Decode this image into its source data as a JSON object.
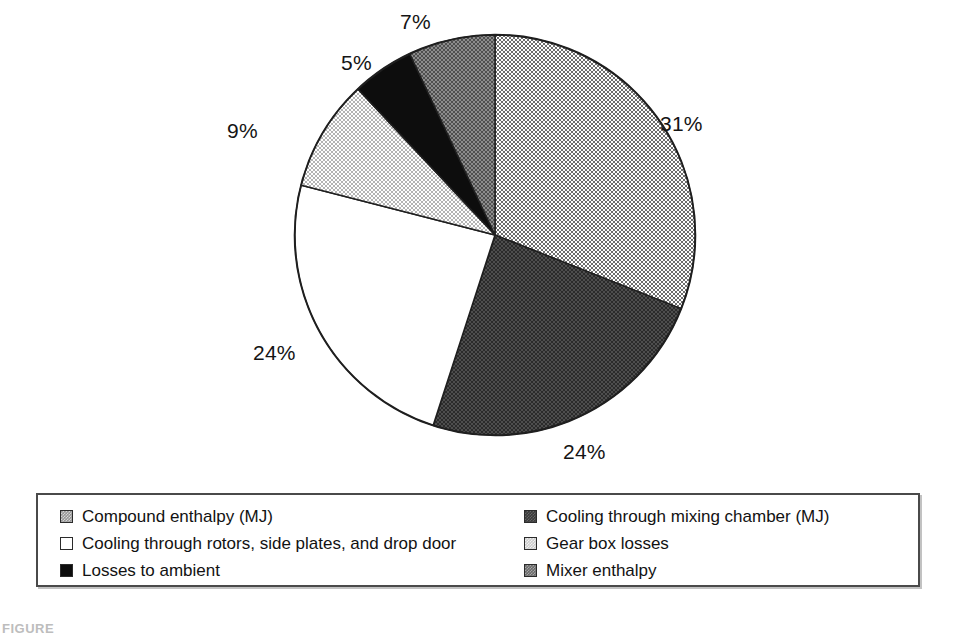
{
  "chart_data": {
    "type": "pie",
    "title": "",
    "subtitle": "",
    "xlabel": "",
    "ylabel": "",
    "legend_position": "bottom",
    "grid": false,
    "start_angle_deg": 0,
    "direction": "clockwise",
    "categories": [
      "Compound enthalpy (MJ)",
      "Cooling through mixing chamber (MJ)",
      "Cooling through rotors, side plates, and drop door",
      "Gear box losses",
      "Losses to ambient",
      "Mixer enthalpy"
    ],
    "values": [
      31,
      24,
      24,
      9,
      5,
      7
    ],
    "data_labels": [
      "31%",
      "24%",
      "24%",
      "9%",
      "5%",
      "7%"
    ],
    "slice_order_clockwise_from_top": [
      "Compound enthalpy (MJ)",
      "Cooling through mixing chamber (MJ)",
      "Cooling through rotors, side plates, and drop door",
      "Gear box losses",
      "Losses to ambient",
      "Mixer enthalpy"
    ],
    "slice_colors": [
      "#969696",
      "#3a3a3a",
      "#ffffff",
      "#cccccc",
      "#0d0d0d",
      "#6b6b6b"
    ],
    "units": "percent"
  },
  "pie": {
    "outline_color": "#1f1f1f",
    "slices": [
      {
        "label": "Compound enthalpy (MJ)",
        "value": 31,
        "display": "31%",
        "fill_class": "fill-midgray",
        "color": "#969696"
      },
      {
        "label": "Cooling through mixing chamber (MJ)",
        "value": 24,
        "display": "24%",
        "fill_class": "fill-darkgray",
        "color": "#3a3a3a"
      },
      {
        "label": "Cooling through rotors, side plates, and drop door",
        "value": 24,
        "display": "24%",
        "fill_class": "fill-white",
        "color": "#ffffff"
      },
      {
        "label": "Gear box losses",
        "value": 9,
        "display": "9%",
        "fill_class": "fill-lightgray",
        "color": "#cccccc"
      },
      {
        "label": "Losses to ambient",
        "value": 5,
        "display": "5%",
        "fill_class": "fill-black",
        "color": "#0d0d0d"
      },
      {
        "label": "Mixer enthalpy",
        "value": 7,
        "display": "7%",
        "fill_class": "fill-meddark",
        "color": "#6b6b6b"
      }
    ]
  },
  "legend": {
    "left_column": [
      {
        "label": "Compound enthalpy (MJ)",
        "fill_class": "fill-midgray",
        "color": "#969696"
      },
      {
        "label": "Cooling through rotors, side plates, and drop door",
        "fill_class": "fill-white",
        "color": "#ffffff"
      },
      {
        "label": "Losses to ambient",
        "fill_class": "fill-black",
        "color": "#0d0d0d"
      }
    ],
    "right_column": [
      {
        "label": "Cooling through mixing chamber (MJ)",
        "fill_class": "fill-darkgray",
        "color": "#3a3a3a"
      },
      {
        "label": "Gear box losses",
        "fill_class": "fill-lightgray",
        "color": "#cccccc"
      },
      {
        "label": "Mixer enthalpy",
        "fill_class": "fill-meddark",
        "color": "#6b6b6b"
      }
    ]
  },
  "caption": {
    "text": "FIGURE"
  }
}
